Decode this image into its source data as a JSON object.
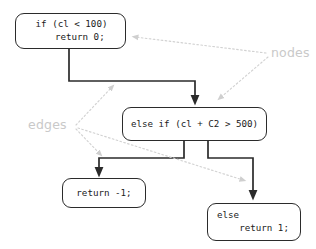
{
  "diagram": {
    "background_color": "#ffffff",
    "node_border_color": "#2b2b2b",
    "edge_color": "#2b2b2b",
    "annotation_color": "#c9c9c9",
    "nodes": [
      {
        "id": "node-if",
        "lines": [
          "if (cl < 100)",
          "   return 0;"
        ],
        "line1": "if (cl < 100)",
        "line2": "   return 0;"
      },
      {
        "id": "node-else-if",
        "lines": [
          "else if (cl + C2 > 500)"
        ],
        "line1": "else if (cl + C2 > 500)"
      },
      {
        "id": "node-return-neg1",
        "lines": [
          "return -1;"
        ],
        "line1": "return -1;"
      },
      {
        "id": "node-else",
        "lines": [
          "else",
          "    return 1;"
        ],
        "line1": "else",
        "line2": "    return 1;"
      }
    ],
    "edges": [
      {
        "id": "edge-if-to-elseif",
        "from": "node-if",
        "to": "node-else-if"
      },
      {
        "id": "edge-elseif-to-return-neg1",
        "from": "node-else-if",
        "to": "node-return-neg1"
      },
      {
        "id": "edge-elseif-to-else",
        "from": "node-else-if",
        "to": "node-else"
      }
    ],
    "annotations": [
      {
        "id": "annotation-nodes",
        "label": "nodes",
        "points_to": [
          "node-if",
          "node-else-if"
        ]
      },
      {
        "id": "annotation-edges",
        "label": "edges",
        "points_to": [
          "edge-if-to-elseif",
          "edge-elseif-to-return-neg1",
          "edge-elseif-to-else"
        ]
      }
    ]
  }
}
